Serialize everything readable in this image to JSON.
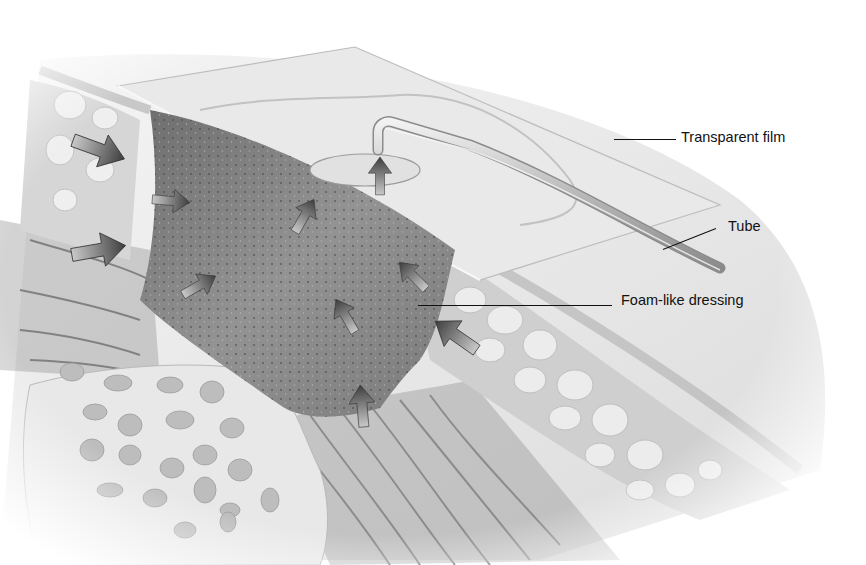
{
  "figure": {
    "labels": [
      {
        "id": "transparent-film",
        "text": "Transparent film",
        "x": 681,
        "y": 130,
        "line": {
          "x1": 614,
          "y1": 139,
          "x2": 676,
          "y2": 139
        }
      },
      {
        "id": "tube",
        "text": "Tube",
        "x": 728,
        "y": 219,
        "line": {
          "x1": 663,
          "y1": 249,
          "x2": 716,
          "y2": 228
        }
      },
      {
        "id": "foam-like-dressing",
        "text": "Foam-like dressing",
        "x": 621,
        "y": 293,
        "line": {
          "x1": 418,
          "y1": 305,
          "x2": 612,
          "y2": 305
        }
      }
    ],
    "arrows": [
      {
        "x": 100,
        "y": 150,
        "angle": 20,
        "size": 1.3
      },
      {
        "x": 172,
        "y": 201,
        "angle": 5,
        "size": 0.9
      },
      {
        "x": 100,
        "y": 250,
        "angle": -10,
        "size": 1.3
      },
      {
        "x": 200,
        "y": 285,
        "angle": -30,
        "size": 0.9
      },
      {
        "x": 305,
        "y": 215,
        "angle": -60,
        "size": 0.9
      },
      {
        "x": 380,
        "y": 175,
        "angle": -90,
        "size": 0.9
      },
      {
        "x": 412,
        "y": 275,
        "angle": -135,
        "size": 0.9
      },
      {
        "x": 345,
        "y": 315,
        "angle": -120,
        "size": 0.9
      },
      {
        "x": 455,
        "y": 335,
        "angle": -145,
        "size": 1.2
      },
      {
        "x": 362,
        "y": 405,
        "angle": -95,
        "size": 1.0
      }
    ],
    "colors": {
      "film": "#e4e4e4",
      "foam": "#8a8a8a",
      "fat": "#d8d8d8",
      "muscle": "#9a9a9a",
      "bone": "#e6e6e6",
      "label_text": "#111111"
    }
  }
}
